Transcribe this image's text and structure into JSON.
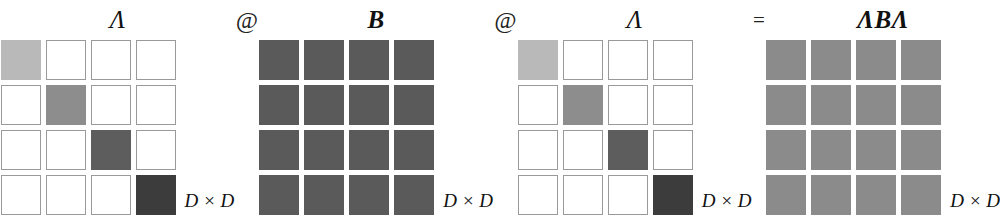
{
  "figure": {
    "caption_free": true,
    "dimension_label": "D × D",
    "dimension_symbol": "D",
    "times_symbol": "×",
    "matrix_size": 4
  },
  "colors": {
    "background": "#ffffff",
    "cell_border": "#9a9a9a",
    "text": "#111111",
    "lambda_diagonal": [
      "#b9b9b9",
      "#8d8d8d",
      "#5d5d5d",
      "#3c3c3c"
    ],
    "b_fill": "#5a5a5a",
    "result_fill": "#8b8b8b"
  },
  "expression": {
    "terms": [
      {
        "id": "lambda-left",
        "label": "Λ",
        "style": "plain"
      },
      {
        "id": "b",
        "label": "B",
        "style": "bold"
      },
      {
        "id": "lambda-right",
        "label": "Λ",
        "style": "plain"
      },
      {
        "id": "result",
        "label": "ΛBΛ",
        "style": "bold"
      }
    ],
    "operators": [
      {
        "id": "op-matmul-1",
        "label": "@",
        "kind": "matmul"
      },
      {
        "id": "op-matmul-2",
        "label": "@",
        "kind": "matmul"
      },
      {
        "id": "op-equals",
        "label": "=",
        "kind": "equals"
      }
    ]
  },
  "matrices": {
    "lambda_left": {
      "name": "Λ",
      "dims": "D × D",
      "pattern": "diagonal",
      "cells": [
        [
          "#b9b9b9",
          null,
          null,
          null
        ],
        [
          null,
          "#8d8d8d",
          null,
          null
        ],
        [
          null,
          null,
          "#5d5d5d",
          null
        ],
        [
          null,
          null,
          null,
          "#3c3c3c"
        ]
      ]
    },
    "b": {
      "name": "B",
      "dims": "D × D",
      "pattern": "dense",
      "cells": [
        [
          "#5a5a5a",
          "#5a5a5a",
          "#5a5a5a",
          "#5a5a5a"
        ],
        [
          "#5a5a5a",
          "#5a5a5a",
          "#5a5a5a",
          "#5a5a5a"
        ],
        [
          "#5a5a5a",
          "#5a5a5a",
          "#5a5a5a",
          "#5a5a5a"
        ],
        [
          "#5a5a5a",
          "#5a5a5a",
          "#5a5a5a",
          "#5a5a5a"
        ]
      ]
    },
    "lambda_right": {
      "name": "Λ",
      "dims": "D × D",
      "pattern": "diagonal",
      "cells": [
        [
          "#b9b9b9",
          null,
          null,
          null
        ],
        [
          null,
          "#8d8d8d",
          null,
          null
        ],
        [
          null,
          null,
          "#5d5d5d",
          null
        ],
        [
          null,
          null,
          null,
          "#3c3c3c"
        ]
      ]
    },
    "result": {
      "name": "ΛBΛ",
      "dims": "D × D",
      "pattern": "dense",
      "cells": [
        [
          "#8b8b8b",
          "#8b8b8b",
          "#8b8b8b",
          "#8b8b8b"
        ],
        [
          "#8b8b8b",
          "#8b8b8b",
          "#8b8b8b",
          "#8b8b8b"
        ],
        [
          "#8b8b8b",
          "#8b8b8b",
          "#8b8b8b",
          "#8b8b8b"
        ],
        [
          "#8b8b8b",
          "#8b8b8b",
          "#8b8b8b",
          "#8b8b8b"
        ]
      ]
    }
  }
}
